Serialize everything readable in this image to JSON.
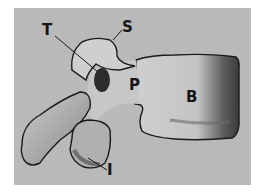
{
  "figure": {
    "labels": [
      {
        "id": "T",
        "text": "T",
        "x": 42,
        "y": 23
      },
      {
        "id": "S",
        "text": "S",
        "x": 122,
        "y": 20
      },
      {
        "id": "P",
        "text": "P",
        "x": 129,
        "y": 78
      },
      {
        "id": "B",
        "text": "B",
        "x": 186,
        "y": 90
      },
      {
        "id": "I",
        "text": "I",
        "x": 107,
        "y": 163
      }
    ],
    "colors": {
      "background_panel": "#b9b9b9",
      "bone_light": "#d2d2d2",
      "bone_shadow": "#5a5a5a",
      "outline": "#1a1a1a"
    }
  }
}
